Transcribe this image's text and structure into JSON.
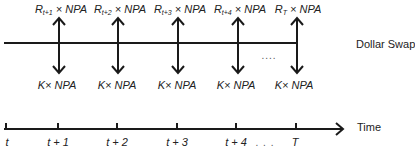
{
  "diagram": {
    "swap_label": "Dollar Swap",
    "time_label": "Time",
    "cashflows": [
      {
        "x": 59,
        "receive_R": "R",
        "receive_sub": "t+1",
        "receive_tail": "× NPA",
        "pay": "K× NPA"
      },
      {
        "x": 118,
        "receive_R": "R",
        "receive_sub": "t+2",
        "receive_tail": "× NPA",
        "pay": "K× NPA"
      },
      {
        "x": 178,
        "receive_R": "R",
        "receive_sub": "t+3",
        "receive_tail": "× NPA",
        "pay": "K× NPA"
      },
      {
        "x": 238,
        "receive_R": "R",
        "receive_sub": "t+4",
        "receive_tail": "× NPA",
        "pay": "K× NPA"
      },
      {
        "x": 297,
        "receive_R": "R",
        "receive_sub": "T",
        "receive_tail": "× NPA",
        "pay": "K× NPA"
      }
    ],
    "swap_dots": "....",
    "time_ticks": [
      {
        "x": 6,
        "label": "t"
      },
      {
        "x": 58,
        "label": "t + 1"
      },
      {
        "x": 117,
        "label": "t + 2"
      },
      {
        "x": 177,
        "label": "t + 3"
      },
      {
        "x": 236,
        "label": "t + 4"
      },
      {
        "x": 296,
        "label": "T"
      }
    ],
    "time_dots": ". . .",
    "colors": {
      "line": "#1a1a1a",
      "text": "#222222"
    }
  }
}
